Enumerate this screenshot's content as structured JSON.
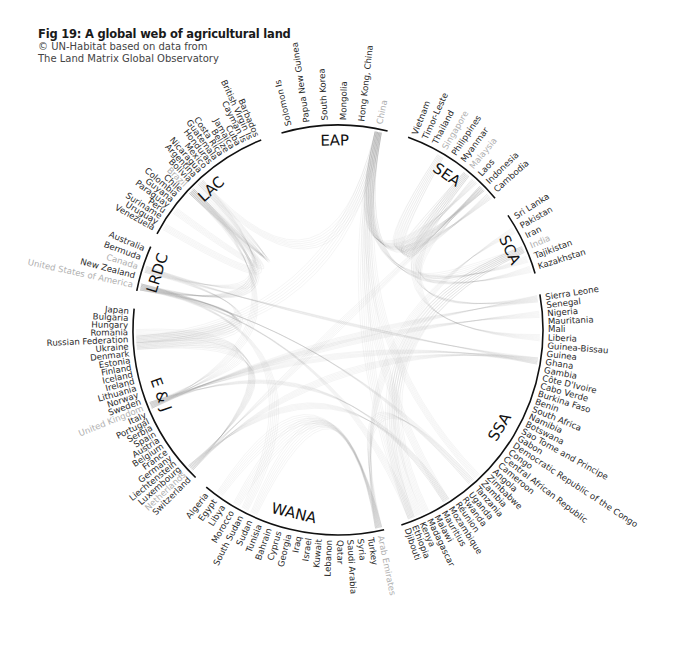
{
  "header": {
    "title": "Fig 19: A global web of agricultural land",
    "source_line1": "© UN-Habitat based on data from",
    "source_line2": "The Land Matrix Global Observatory"
  },
  "chart_data": {
    "type": "chord",
    "title": "Fig 19: A global web of agricultural land",
    "subtitle": "© UN-Habitat based on data from The Land Matrix Global Observatory",
    "note": "Greyed country names indicate investor countries shown in lighter tone",
    "regions": [
      {
        "code": "EAP",
        "start_deg": -16,
        "end_deg": 14,
        "countries": [
          {
            "name": "Solomon Is"
          },
          {
            "name": "Papua New Guinea"
          },
          {
            "name": "South Korea"
          },
          {
            "name": "Mongolia"
          },
          {
            "name": "Hong Kong, China"
          },
          {
            "name": "China",
            "grey": true
          }
        ]
      },
      {
        "code": "SEA",
        "start_deg": 20,
        "end_deg": 50,
        "countries": [
          {
            "name": "Vietnam"
          },
          {
            "name": "Timor-Leste"
          },
          {
            "name": "Thailand"
          },
          {
            "name": "Singapore",
            "grey": true
          },
          {
            "name": "Philippines"
          },
          {
            "name": "Myanmar"
          },
          {
            "name": "Malaysia",
            "grey": true
          },
          {
            "name": "Laos"
          },
          {
            "name": "Indonesia"
          },
          {
            "name": "Cambodia"
          }
        ]
      },
      {
        "code": "SCA",
        "start_deg": 56,
        "end_deg": 74,
        "countries": [
          {
            "name": "Sri Lanka"
          },
          {
            "name": "Pakistan"
          },
          {
            "name": "Iran"
          },
          {
            "name": "India",
            "grey": true
          },
          {
            "name": "Tajikistan"
          },
          {
            "name": "Kazakhstan"
          }
        ]
      },
      {
        "code": "SSA",
        "start_deg": 80,
        "end_deg": 162,
        "countries": [
          {
            "name": "Sierra Leone"
          },
          {
            "name": "Senegal"
          },
          {
            "name": "Nigeria"
          },
          {
            "name": "Mauritania"
          },
          {
            "name": "Mali"
          },
          {
            "name": "Liberia"
          },
          {
            "name": "Guinea-Bissau"
          },
          {
            "name": "Guinea"
          },
          {
            "name": "Ghana"
          },
          {
            "name": "Gambia"
          },
          {
            "name": "Côte D'Ivoire"
          },
          {
            "name": "Cabo Verde"
          },
          {
            "name": "Burkina Faso"
          },
          {
            "name": "Benin"
          },
          {
            "name": "South Africa"
          },
          {
            "name": "Namibia"
          },
          {
            "name": "Botswana"
          },
          {
            "name": "Sao Tome and Principe"
          },
          {
            "name": "Gabon"
          },
          {
            "name": "Democratic Republic of the Congo"
          },
          {
            "name": "Congo"
          },
          {
            "name": "Central African Republic"
          },
          {
            "name": "Cameroon"
          },
          {
            "name": "Angola"
          },
          {
            "name": "Zimbabwe"
          },
          {
            "name": "Zambia"
          },
          {
            "name": "Tanzania"
          },
          {
            "name": "Uganda"
          },
          {
            "name": "Rwanda"
          },
          {
            "name": "Réunion"
          },
          {
            "name": "Mozambique"
          },
          {
            "name": "Mauritius"
          },
          {
            "name": "Malawi"
          },
          {
            "name": "Madagascar"
          },
          {
            "name": "Kenya"
          },
          {
            "name": "Ethiopia"
          },
          {
            "name": "Djibouti"
          }
        ]
      },
      {
        "code": "WANA",
        "start_deg": 167,
        "end_deg": 220,
        "countries": [
          {
            "name": "Arab Emirates",
            "grey": true
          },
          {
            "name": "Turkey"
          },
          {
            "name": "Syria"
          },
          {
            "name": "Saudi Arabia"
          },
          {
            "name": "Qatar"
          },
          {
            "name": "Lebanon"
          },
          {
            "name": "Kuwait"
          },
          {
            "name": "Israel"
          },
          {
            "name": "Iraq"
          },
          {
            "name": "Georgia"
          },
          {
            "name": "Cyprus"
          },
          {
            "name": "Bahrain"
          },
          {
            "name": "Tunisia"
          },
          {
            "name": "Sudan"
          },
          {
            "name": "South Sudan"
          },
          {
            "name": "Morocco"
          },
          {
            "name": "Libya"
          },
          {
            "name": "Egypt"
          },
          {
            "name": "Algeria"
          }
        ]
      },
      {
        "code": "E & J",
        "start_deg": 224,
        "end_deg": 276,
        "countries": [
          {
            "name": "Switzerland"
          },
          {
            "name": "Netherlands",
            "grey": true
          },
          {
            "name": "Luxembourg"
          },
          {
            "name": "Liechtenstein"
          },
          {
            "name": "Germany"
          },
          {
            "name": "France"
          },
          {
            "name": "Belgium"
          },
          {
            "name": "Austria"
          },
          {
            "name": "Spain"
          },
          {
            "name": "Serbia"
          },
          {
            "name": "Portugal"
          },
          {
            "name": "Italy"
          },
          {
            "name": "United Kingdom",
            "grey": true
          },
          {
            "name": "Sweden"
          },
          {
            "name": "Norway"
          },
          {
            "name": "Lithuania"
          },
          {
            "name": "Ireland"
          },
          {
            "name": "Iceland"
          },
          {
            "name": "Finland"
          },
          {
            "name": "Estonia"
          },
          {
            "name": "Denmark"
          },
          {
            "name": "Ukraine"
          },
          {
            "name": "Russian Federation"
          },
          {
            "name": "Romania"
          },
          {
            "name": "Hungary"
          },
          {
            "name": "Bulgaria"
          },
          {
            "name": "Japan"
          }
        ]
      },
      {
        "code": "LRDC",
        "start_deg": 281,
        "end_deg": 294,
        "countries": [
          {
            "name": "United States of America",
            "grey": true
          },
          {
            "name": "New Zealand"
          },
          {
            "name": "Canada",
            "grey": true
          },
          {
            "name": "Bermuda"
          },
          {
            "name": "Australia"
          }
        ]
      },
      {
        "code": "LAC",
        "start_deg": 298,
        "end_deg": 338,
        "countries": [
          {
            "name": "Venezuela"
          },
          {
            "name": "Uruguay"
          },
          {
            "name": "Suriname"
          },
          {
            "name": "Peru"
          },
          {
            "name": "Paraguay"
          },
          {
            "name": "Guyana"
          },
          {
            "name": "Colombia"
          },
          {
            "name": "Chile"
          },
          {
            "name": "Brazil",
            "grey": true
          },
          {
            "name": "Bolivia"
          },
          {
            "name": "Argentina"
          },
          {
            "name": "Nicaragua"
          },
          {
            "name": "Mexico"
          },
          {
            "name": "Honduras"
          },
          {
            "name": "Guatemala"
          },
          {
            "name": "Costa Rica"
          },
          {
            "name": "Belize"
          },
          {
            "name": "Jamaica"
          },
          {
            "name": "Cuba"
          },
          {
            "name": "Cayman Is"
          },
          {
            "name": "British Virgin Is"
          },
          {
            "name": "Barbados"
          }
        ]
      }
    ],
    "chords": [
      [
        "China",
        "Laos"
      ],
      [
        "China",
        "Cambodia"
      ],
      [
        "China",
        "Zambia"
      ],
      [
        "China",
        "Russian Federation"
      ],
      [
        "China",
        "Indonesia"
      ],
      [
        "China",
        "Mozambique"
      ],
      [
        "China",
        "Argentina"
      ],
      [
        "China",
        "Ethiopia"
      ],
      [
        "China",
        "Kazakhstan"
      ],
      [
        "China",
        "Tajikistan"
      ],
      [
        "Singapore",
        "Indonesia"
      ],
      [
        "Singapore",
        "Cambodia"
      ],
      [
        "Malaysia",
        "Indonesia"
      ],
      [
        "Malaysia",
        "Liberia"
      ],
      [
        "Malaysia",
        "Sierra Leone"
      ],
      [
        "Malaysia",
        "Laos"
      ],
      [
        "India",
        "Ethiopia"
      ],
      [
        "India",
        "Madagascar"
      ],
      [
        "India",
        "Indonesia"
      ],
      [
        "India",
        "Kenya"
      ],
      [
        "Arab Emirates",
        "Sudan"
      ],
      [
        "Arab Emirates",
        "Morocco"
      ],
      [
        "Arab Emirates",
        "Egypt"
      ],
      [
        "Arab Emirates",
        "Pakistan"
      ],
      [
        "Arab Emirates",
        "Tanzania"
      ],
      [
        "United Kingdom",
        "Sierra Leone"
      ],
      [
        "United Kingdom",
        "Ghana"
      ],
      [
        "United Kingdom",
        "Nigeria"
      ],
      [
        "United Kingdom",
        "Ukraine"
      ],
      [
        "United Kingdom",
        "Mozambique"
      ],
      [
        "United Kingdom",
        "Brazil"
      ],
      [
        "Netherlands",
        "Ghana"
      ],
      [
        "Netherlands",
        "Romania"
      ],
      [
        "Netherlands",
        "Ukraine"
      ],
      [
        "Netherlands",
        "Mozambique"
      ],
      [
        "Netherlands",
        "Indonesia"
      ],
      [
        "United States of America",
        "Brazil"
      ],
      [
        "United States of America",
        "Ukraine"
      ],
      [
        "United States of America",
        "Russian Federation"
      ],
      [
        "United States of America",
        "Argentina"
      ],
      [
        "United States of America",
        "Ethiopia"
      ],
      [
        "United States of America",
        "South Sudan"
      ],
      [
        "United States of America",
        "Tanzania"
      ],
      [
        "Canada",
        "Brazil"
      ],
      [
        "Canada",
        "Russian Federation"
      ],
      [
        "Canada",
        "Ghana"
      ],
      [
        "Brazil",
        "Paraguay"
      ],
      [
        "Brazil",
        "Bolivia"
      ],
      [
        "Brazil",
        "Uruguay"
      ],
      [
        "Brazil",
        "Argentina"
      ]
    ]
  }
}
